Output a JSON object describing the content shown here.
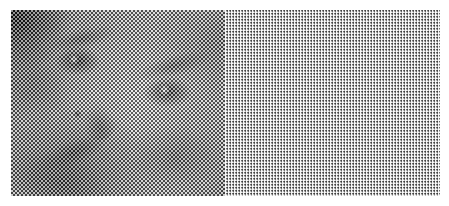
{
  "figure": {
    "orientation": "side-by-side, two panels",
    "canvas": {
      "width_px": 449,
      "height_px": 206,
      "background_color": "#ffffff",
      "margin_left_px": 11,
      "margin_top_px": 10,
      "content_width_px": 429,
      "content_height_px": 186,
      "split_x_px": 225
    },
    "panels": [
      {
        "id": "left",
        "label": "checkerboard-dither",
        "pattern": "2px alternating checkerboard dither",
        "cell_size_px": 2,
        "contrast": "low / flat midtone",
        "dark_color": "#1a1a1a",
        "light_color": "#e8e8e8",
        "mid_tone": "#b5b5b5",
        "notes": "face rendered in soft grays; dark hair mass fills the upper-left corner"
      },
      {
        "id": "right",
        "label": "grid-mesh-dither",
        "pattern": "3px orthogonal grid mesh with white rule lines",
        "cell_size_px": 3,
        "contrast": "high / blown highlights",
        "dark_color": "#101010",
        "light_color": "#ffffff",
        "mid_tone": "#9a9a9a",
        "notes": "same face with strong contrast; white grid lines overlay both axes"
      }
    ],
    "features": [
      {
        "name": "hair-mass",
        "panel": "both",
        "position": "upper-left corner",
        "tone": "very dark"
      },
      {
        "name": "left-eyebrow",
        "panel": "both",
        "position": "upper-left-third",
        "tone": "dark"
      },
      {
        "name": "left-eye",
        "panel": "both",
        "position": "upper-left-third",
        "tone": "dark with catchlight"
      },
      {
        "name": "right-eyebrow",
        "panel": "both",
        "position": "upper-right",
        "tone": "dark"
      },
      {
        "name": "right-eye",
        "panel": "both",
        "position": "center-right",
        "tone": "dark with bright catchlight"
      },
      {
        "name": "nose",
        "panel": "both",
        "position": "center",
        "tone": "mid with shadow"
      },
      {
        "name": "nostril",
        "panel": "both",
        "position": "center-left",
        "tone": "dark point"
      },
      {
        "name": "mouth",
        "panel": "both",
        "position": "lower-left",
        "tone": "dark diagonal band"
      },
      {
        "name": "cheek-shadow",
        "panel": "both",
        "position": "lower-right",
        "tone": "mid-dark"
      },
      {
        "name": "jaw-line",
        "panel": "both",
        "position": "bottom-left",
        "tone": "dark diagonal"
      }
    ]
  }
}
